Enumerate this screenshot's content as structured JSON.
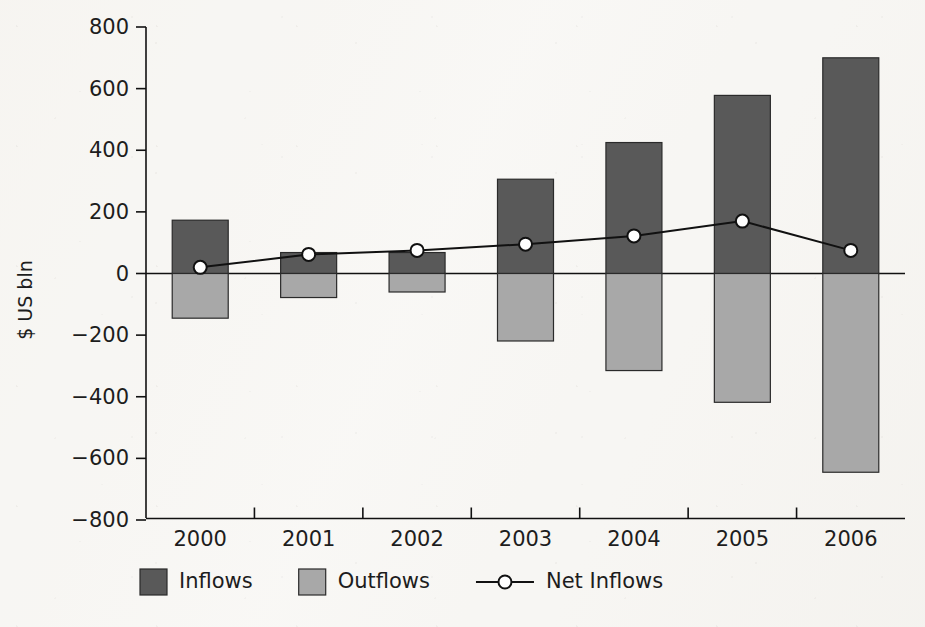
{
  "chart_data": {
    "type": "bar",
    "title": "",
    "subtitle": "",
    "xlabel": "",
    "ylabel": "$ US bln",
    "categories": [
      "2000",
      "2001",
      "2002",
      "2003",
      "2004",
      "2005",
      "2006"
    ],
    "ylim": [
      -800,
      800
    ],
    "y_ticks": [
      800,
      600,
      400,
      200,
      0,
      -200,
      -400,
      -600,
      -800
    ],
    "y_tick_labels": [
      "800",
      "600",
      "400",
      "200",
      "0",
      "−200",
      "−400",
      "−600",
      "−800"
    ],
    "grid": false,
    "legend_position": "bottom",
    "series": [
      {
        "name": "Inflows",
        "type": "bar",
        "color": "#595959",
        "values": [
          173,
          68,
          68,
          306,
          425,
          578,
          700
        ]
      },
      {
        "name": "Outflows",
        "type": "bar",
        "color": "#a8a8a8",
        "values": [
          -145,
          -78,
          -60,
          -219,
          -315,
          -418,
          -645
        ]
      },
      {
        "name": "Net Inflows",
        "type": "line",
        "color": "#111111",
        "marker": "open-circle",
        "values": [
          20,
          62,
          75,
          95,
          122,
          170,
          75
        ]
      }
    ]
  },
  "legend": {
    "items": [
      {
        "label": "Inflows",
        "swatch": "#595959",
        "kind": "swatch"
      },
      {
        "label": "Outflows",
        "swatch": "#a8a8a8",
        "kind": "swatch"
      },
      {
        "label": "Net Inflows",
        "swatch": "#111111",
        "kind": "line-marker"
      }
    ]
  },
  "colors": {
    "inflow": "#595959",
    "outflow": "#a8a8a8",
    "net_line": "#111111",
    "axis": "#111111",
    "background": "#f7f6f3"
  }
}
